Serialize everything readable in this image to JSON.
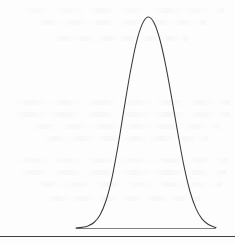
{
  "page": {
    "width": 235,
    "height": 244,
    "background_color": "#fdfdfd"
  },
  "colors": {
    "curve_stroke": "#3a3a3a",
    "baseline_stroke": "#808080",
    "rule_stroke": "#404040",
    "page_background": "#fdfdfd",
    "bleed_through_ink": "#78737d"
  },
  "figure": {
    "name": "bell-curve",
    "caption": "",
    "title": "",
    "xlabel": "",
    "ylabel": "",
    "curve_stroke_width": 1,
    "baseline_stroke_width": 1,
    "peak": {
      "x": 148,
      "y": 17
    },
    "baseline": {
      "y": 228,
      "x_start": 76,
      "x_end": 216
    }
  },
  "bottom_rule": {
    "y": 236,
    "x_start": 0,
    "x_end": 235,
    "thickness": 1.4
  },
  "bleed_through": {
    "visible": true,
    "legible": false,
    "note": "faint mirrored ink showing through from the reverse side of the page",
    "bands": [
      {
        "top": 8,
        "left": 12,
        "width": 212
      },
      {
        "top": 20,
        "left": 28,
        "width": 178
      },
      {
        "top": 36,
        "left": 48,
        "width": 140
      },
      {
        "top": 100,
        "left": 6,
        "width": 224
      },
      {
        "top": 112,
        "left": 4,
        "width": 226
      },
      {
        "top": 124,
        "left": 22,
        "width": 198
      },
      {
        "top": 136,
        "left": 36,
        "width": 172
      },
      {
        "top": 158,
        "left": 8,
        "width": 220
      },
      {
        "top": 170,
        "left": 10,
        "width": 216
      },
      {
        "top": 182,
        "left": 26,
        "width": 196
      },
      {
        "top": 196,
        "left": 40,
        "width": 160
      }
    ]
  },
  "chart_data": {
    "type": "line",
    "title": "",
    "subtitle": "",
    "xlabel": "",
    "ylabel": "",
    "legend": [],
    "legend_position": "none",
    "grid": false,
    "axis_visible": false,
    "tick_labels_x": [],
    "tick_labels_y": [],
    "xlim": [
      76,
      216
    ],
    "ylim": [
      0,
      1
    ],
    "distribution": "normal",
    "mean_x_px": 148,
    "stddev_x_px": 22,
    "peak_y_px": 17,
    "baseline_y_px": 228,
    "series": [
      {
        "name": "normal-distribution",
        "x": [
          76,
          82,
          88,
          94,
          100,
          106,
          112,
          118,
          124,
          130,
          136,
          142,
          148,
          154,
          160,
          166,
          172,
          178,
          184,
          190,
          196,
          202,
          208,
          214,
          216
        ],
        "y": [
          0.0,
          0.003,
          0.01,
          0.026,
          0.062,
          0.129,
          0.238,
          0.389,
          0.563,
          0.731,
          0.872,
          0.964,
          1.0,
          0.973,
          0.891,
          0.764,
          0.608,
          0.445,
          0.293,
          0.173,
          0.092,
          0.043,
          0.018,
          0.005,
          0.002
        ]
      }
    ]
  }
}
